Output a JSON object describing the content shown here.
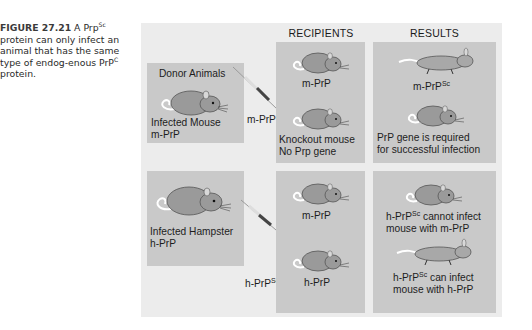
{
  "caption": {
    "figure_label": "FIGURE 27.21",
    "text_part1": " A Prp",
    "sup1": "Sc",
    "text_part2": " protein can only infect an animal that has the same type of endog-enous PrP",
    "sup2": "C",
    "text_part3": " protein."
  },
  "columns": {
    "recipients": "RECIPIENTS",
    "results": "RESULTS"
  },
  "donors": [
    {
      "heading": "Donor Animals",
      "line1": "Infected Mouse",
      "line2": "m-PrP",
      "injection_label": "m-PrP",
      "injection_sup": "Sc"
    },
    {
      "line1": "Infected Hampster",
      "line2": "h-PrP",
      "injection_label": "h-PrP",
      "injection_sup": "Sc"
    }
  ],
  "recipients": [
    {
      "label": "m-PrP"
    },
    {
      "line1": "Knockout mouse",
      "line2": "No Prp gene"
    },
    {
      "label": "m-PrP"
    },
    {
      "label": "h-PrP"
    }
  ],
  "results": [
    {
      "label": "m-PrP",
      "sup": "Sc",
      "state": "dead"
    },
    {
      "line1": "PrP gene is required",
      "line2": "for successful infection",
      "state": "healthy"
    },
    {
      "line1_pre": "h-PrP",
      "line1_sup": "Sc",
      "line1_post": " cannot infect",
      "line2": "mouse with m-PrP",
      "state": "healthy"
    },
    {
      "line1_pre": "h-PrP",
      "line1_sup": "Sc",
      "line1_post": " can infect",
      "line2": "mouse with h-PrP",
      "state": "dead"
    }
  ],
  "colors": {
    "figure_bg": "#ececec",
    "panel_bg": "#c9c9c9",
    "mouse_body": "#9a9a9a",
    "syringe_fill": "#444444"
  }
}
